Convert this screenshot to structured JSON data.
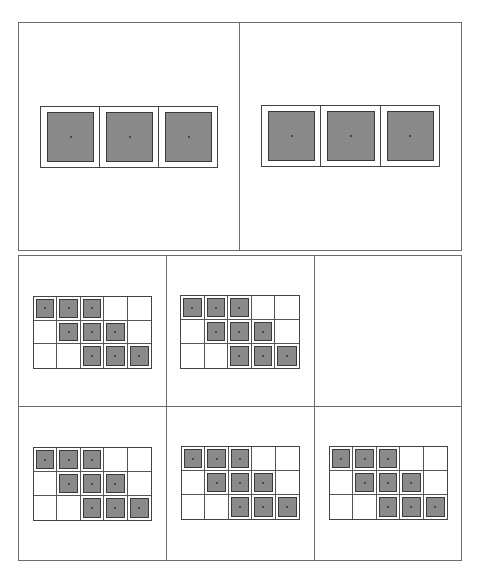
{
  "figure": {
    "fill_color": "#8a8a8a",
    "line_color": "#444444",
    "top_row": {
      "panels": [
        {
          "id": "strip-left",
          "cells": [
            1,
            1,
            1
          ]
        },
        {
          "id": "strip-right",
          "cells": [
            1,
            1,
            1
          ]
        }
      ]
    },
    "bottom_grid": {
      "panels": [
        {
          "id": "grid-1",
          "rows": 3,
          "cols": 5,
          "filled": [
            [
              1,
              1,
              1,
              0,
              0
            ],
            [
              0,
              1,
              1,
              1,
              0
            ],
            [
              0,
              0,
              1,
              1,
              1
            ]
          ]
        },
        {
          "id": "grid-2",
          "rows": 3,
          "cols": 5,
          "filled": [
            [
              1,
              1,
              1,
              0,
              0
            ],
            [
              0,
              1,
              1,
              1,
              0
            ],
            [
              0,
              0,
              1,
              1,
              1
            ]
          ]
        },
        {
          "id": "empty-panel",
          "rows": 0,
          "cols": 0,
          "filled": []
        },
        {
          "id": "grid-4",
          "rows": 3,
          "cols": 5,
          "filled": [
            [
              1,
              1,
              1,
              0,
              0
            ],
            [
              0,
              1,
              1,
              1,
              0
            ],
            [
              0,
              0,
              1,
              1,
              1
            ]
          ]
        },
        {
          "id": "grid-5",
          "rows": 3,
          "cols": 5,
          "filled": [
            [
              1,
              1,
              1,
              0,
              0
            ],
            [
              0,
              1,
              1,
              1,
              0
            ],
            [
              0,
              0,
              1,
              1,
              1
            ]
          ]
        },
        {
          "id": "grid-6",
          "rows": 3,
          "cols": 5,
          "filled": [
            [
              1,
              1,
              1,
              0,
              0
            ],
            [
              0,
              1,
              1,
              1,
              0
            ],
            [
              0,
              0,
              1,
              1,
              1
            ]
          ]
        }
      ]
    }
  }
}
